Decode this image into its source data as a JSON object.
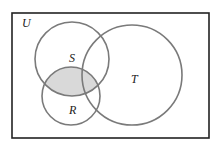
{
  "diagram": {
    "type": "venn",
    "universe": {
      "label": "U",
      "rect": {
        "x": 12,
        "y": 13,
        "width": 197,
        "height": 125
      },
      "stroke": "#222222",
      "fill": "#ffffff"
    },
    "sets": [
      {
        "name": "S",
        "label": "S",
        "cx": 72,
        "cy": 59,
        "r": 37,
        "label_x": 69,
        "label_y": 62
      },
      {
        "name": "R",
        "label": "R",
        "cx": 71,
        "cy": 96,
        "r": 29,
        "label_x": 69,
        "label_y": 114
      },
      {
        "name": "T",
        "label": "T",
        "cx": 132,
        "cy": 75,
        "r": 50,
        "label_x": 131,
        "label_y": 83
      }
    ],
    "circle_stroke": "#7a7a7a",
    "shaded_region": {
      "description": "S ∩ R",
      "sets": [
        "S",
        "R"
      ],
      "fill": "#d9d9d9"
    },
    "universe_label_pos": {
      "x": 22,
      "y": 27
    }
  }
}
